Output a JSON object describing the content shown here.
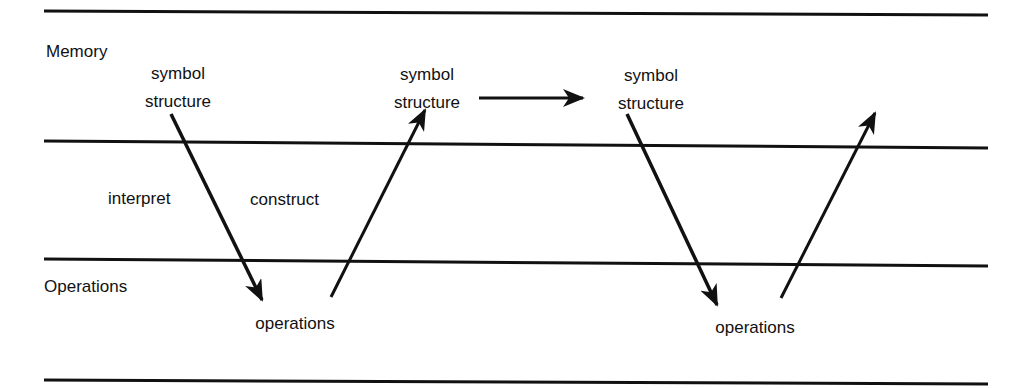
{
  "rows": {
    "memory": "Memory",
    "operations": "Operations"
  },
  "nodes": {
    "symbol1": {
      "line1": "symbol",
      "line2": "structure"
    },
    "symbol2": {
      "line1": "symbol",
      "line2": "structure"
    },
    "symbol3": {
      "line1": "symbol",
      "line2": "structure"
    },
    "ops1": "operations",
    "ops2": "operations"
  },
  "edges": {
    "interpret": "interpret",
    "construct": "construct"
  },
  "colors": {
    "line": "#111111",
    "background": "#ffffff"
  }
}
